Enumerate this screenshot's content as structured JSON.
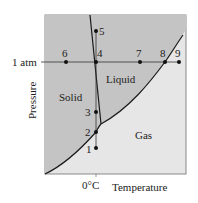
{
  "diagram": {
    "type": "phase-diagram",
    "axes": {
      "y_label": "Pressure",
      "x_label": "Temperature",
      "y_tick": "1 atm",
      "x_tick": "0°C"
    },
    "regions": {
      "solid": "Solid",
      "liquid": "Liquid",
      "gas": "Gas"
    },
    "points": [
      {
        "id": "1",
        "label": "1"
      },
      {
        "id": "2",
        "label": "2"
      },
      {
        "id": "3",
        "label": "3"
      },
      {
        "id": "4",
        "label": "4"
      },
      {
        "id": "5",
        "label": "5"
      },
      {
        "id": "6",
        "label": "6"
      },
      {
        "id": "7",
        "label": "7"
      },
      {
        "id": "8",
        "label": "8"
      },
      {
        "id": "9",
        "label": "9"
      }
    ],
    "colors": {
      "solid_liquid_fill": "#c4c4c4",
      "gas_fill": "#e6e6e6",
      "lines": "#1a1a1a",
      "background": "#ffffff"
    }
  }
}
